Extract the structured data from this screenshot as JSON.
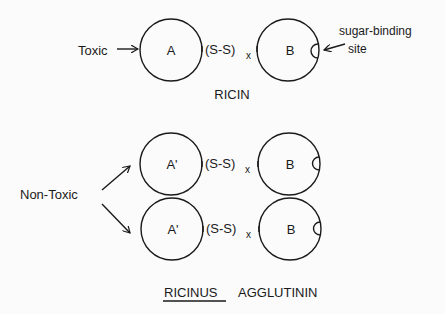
{
  "ricin": {
    "title": "RICIN",
    "left_label": "Toxic",
    "chain_a": "A",
    "chain_b": "B",
    "bond": "(S-S)",
    "bond_sub": "x",
    "site_label_line1": "sugar-binding",
    "site_label_line2": "site"
  },
  "agglutinin": {
    "title_underlined": "RICINUS",
    "title_rest": "AGGLUTININ",
    "left_label": "Non-Toxic",
    "rows": [
      {
        "chain_a": "A'",
        "chain_b": "B",
        "bond": "(S-S)",
        "bond_sub": "x"
      },
      {
        "chain_a": "A'",
        "chain_b": "B",
        "bond": "(S-S)",
        "bond_sub": "x"
      }
    ]
  },
  "colors": {
    "stroke": "#1a1a1a",
    "background": "#fbfbfb"
  }
}
